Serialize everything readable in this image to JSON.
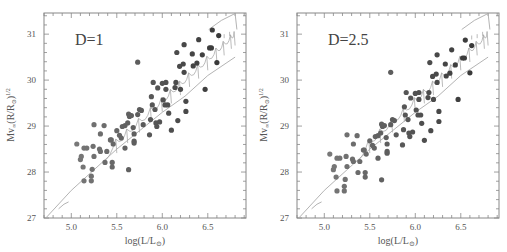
{
  "figure": {
    "panels_count": 2
  },
  "chart_data": [
    {
      "type": "scatter",
      "title": "",
      "annotation": "D=1",
      "xlabel": "log(L/L⊙)",
      "ylabel": "Mv∞(R/R⊙)^1/2",
      "xlim": [
        4.7,
        6.92
      ],
      "ylim": [
        27,
        31.46
      ],
      "xticks": [
        5.0,
        5.5,
        6.0,
        6.5
      ],
      "xtick_labels": [
        "5.0",
        "5.5",
        "6.0",
        "6.5"
      ],
      "yticks": [
        27,
        28,
        29,
        30,
        31
      ],
      "ytick_labels": [
        "27",
        "28",
        "29",
        "30",
        "31"
      ],
      "grid": false,
      "legend": "none",
      "series": [
        {
          "name": "observed stars",
          "marker": "filled-circle",
          "x": [
            5.06,
            5.1,
            5.11,
            5.13,
            5.14,
            5.17,
            5.14,
            5.22,
            5.25,
            5.23,
            5.22,
            5.24,
            5.25,
            5.31,
            5.32,
            5.32,
            5.36,
            5.37,
            5.39,
            5.43,
            5.44,
            5.45,
            5.45,
            5.46,
            5.5,
            5.53,
            5.56,
            5.59,
            5.62,
            5.63,
            5.63,
            5.64,
            5.66,
            5.59,
            5.55,
            5.68,
            5.69,
            5.69,
            5.69,
            5.73,
            5.73,
            5.75,
            5.77,
            5.79,
            5.86,
            5.87,
            5.88,
            5.89,
            5.9,
            5.92,
            5.93,
            5.94,
            5.95,
            5.97,
            6.0,
            6.01,
            6.03,
            6.04,
            6.04,
            6.06,
            6.07,
            6.1,
            6.14,
            6.15,
            6.16,
            6.17,
            6.2,
            6.19,
            6.23,
            6.24,
            6.24,
            6.26,
            6.26,
            6.33,
            6.34,
            6.38,
            6.4,
            6.44,
            6.47,
            6.52,
            6.54,
            6.55,
            6.6,
            6.62
          ],
          "y": [
            28.61,
            28.27,
            28.34,
            28.11,
            28.52,
            28.52,
            27.81,
            27.81,
            29.03,
            28.06,
            27.91,
            28.56,
            28.34,
            28.5,
            28.45,
            28.83,
            29.01,
            28.21,
            28.45,
            28.7,
            28.7,
            28.21,
            28.11,
            28.61,
            28.9,
            28.8,
            28.99,
            29.01,
            29.07,
            28.05,
            29.26,
            29.21,
            29.23,
            28.52,
            28.74,
            28.97,
            28.83,
            28.67,
            28.63,
            29.25,
            30.39,
            29.36,
            29.34,
            29.03,
            28.81,
            29.14,
            29.64,
            29.46,
            29.95,
            29.36,
            29.07,
            28.99,
            29.83,
            29.09,
            29.93,
            29.57,
            29.46,
            29.95,
            29.8,
            29.46,
            29.28,
            28.91,
            29.84,
            29.95,
            30.6,
            29.12,
            29.8,
            30.3,
            30.35,
            30.77,
            30.17,
            29.54,
            29.32,
            30.57,
            30.31,
            30.37,
            30.88,
            30.55,
            29.8,
            30.7,
            30.7,
            31.09,
            30.38,
            30.97
          ]
        },
        {
          "name": "model track (straight)",
          "type": "line",
          "x": [
            4.72,
            5.0,
            5.5,
            6.0,
            6.25,
            6.5,
            6.8
          ],
          "y": [
            27.0,
            27.6,
            28.5,
            29.3,
            29.65,
            30.1,
            30.5
          ]
        },
        {
          "name": "model track (lower short branch)",
          "type": "line",
          "x": [
            4.86,
            4.92,
            4.97
          ],
          "y": [
            27.2,
            27.3,
            27.35
          ]
        },
        {
          "name": "model track (upper branch)",
          "type": "line",
          "x": [
            6.51,
            6.65,
            6.8,
            6.82
          ],
          "y": [
            31.1,
            31.3,
            31.45,
            31.1
          ]
        }
      ]
    },
    {
      "type": "scatter",
      "title": "",
      "annotation": "D=2.5",
      "xlabel": "log(L/L⊙)",
      "ylabel": "Mv∞(R/R⊙)^1/2",
      "xlim": [
        4.7,
        6.92
      ],
      "ylim": [
        27,
        31.46
      ],
      "xticks": [
        5.0,
        5.5,
        6.0,
        6.5
      ],
      "xtick_labels": [
        "5.0",
        "5.5",
        "6.0",
        "6.5"
      ],
      "yticks": [
        27,
        28,
        29,
        30,
        31
      ],
      "ytick_labels": [
        "27",
        "28",
        "29",
        "30",
        "31"
      ],
      "grid": false,
      "legend": "none",
      "y_offset_from_D1": -0.22,
      "series": [
        {
          "name": "observed stars",
          "marker": "filled-circle",
          "note": "same x as D=1 panel, y shifted by about -0.22"
        },
        {
          "name": "model track (straight)",
          "type": "line",
          "x": [
            4.72,
            5.0,
            5.5,
            6.0,
            6.25,
            6.5,
            6.8
          ],
          "y": [
            27.0,
            27.6,
            28.5,
            29.3,
            29.65,
            30.1,
            30.5
          ]
        }
      ]
    }
  ],
  "panels": [
    {
      "annotation": "D=1",
      "xlabel_main": "log(L/L",
      "xlabel_sub": "⊙",
      "xlabel_close": ")",
      "ylabel_main": "Mv",
      "ylabel_sub": "∞",
      "ylabel_mid": "(R/R",
      "ylabel_sub2": "⊙",
      "ylabel_close": ")",
      "ylabel_sup": "1/2"
    },
    {
      "annotation": "D=2.5",
      "xlabel_main": "log(L/L",
      "xlabel_sub": "⊙",
      "xlabel_close": ")",
      "ylabel_main": "Mv",
      "ylabel_sub": "∞",
      "ylabel_mid": "(R/R",
      "ylabel_sub2": "⊙",
      "ylabel_close": ")",
      "ylabel_sup": "1/2"
    }
  ],
  "style": {
    "frame_color": "#888888",
    "line_color": "#aaaaaa",
    "dot_dark": "#3a3a3a",
    "dot_light": "#7a7a7a",
    "text_color": "#555555"
  }
}
